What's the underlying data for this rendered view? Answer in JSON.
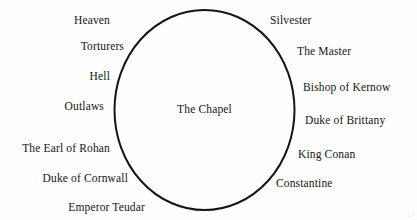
{
  "diagram": {
    "type": "venn-single-set",
    "center_label": "The Chapel",
    "shape": {
      "kind": "ellipse",
      "stroke_color": "#151515",
      "stroke_width": 2,
      "fill": "none",
      "cx": 204.5,
      "cy": 110,
      "rx": 90,
      "ry": 100
    },
    "background_color": "#fefefe",
    "text_color": "#151515",
    "outside_left_labels": [
      {
        "text": "Heaven",
        "right": 307,
        "top": 14
      },
      {
        "text": "Torturers",
        "right": 293,
        "top": 40
      },
      {
        "text": "Hell",
        "right": 307,
        "top": 70
      },
      {
        "text": "Outlaws",
        "right": 313,
        "top": 100
      },
      {
        "text": "The Earl of Rohan",
        "right": 307,
        "top": 142
      },
      {
        "text": "Duke of Cornwall",
        "right": 289,
        "top": 172
      },
      {
        "text": "Emperor Teudar",
        "right": 272,
        "top": 201
      }
    ],
    "outside_right_labels": [
      {
        "text": "Silvester",
        "left": 270,
        "top": 14
      },
      {
        "text": "The Master",
        "left": 297,
        "top": 45
      },
      {
        "text": "Bishop of Kernow",
        "left": 303,
        "top": 81
      },
      {
        "text": "Duke of Brittany",
        "left": 305,
        "top": 114
      },
      {
        "text": "King Conan",
        "left": 298,
        "top": 148
      },
      {
        "text": "Constantine",
        "left": 276,
        "top": 177
      }
    ],
    "inside_members": [
      "The Chapel"
    ],
    "corner_artifact": "17"
  }
}
